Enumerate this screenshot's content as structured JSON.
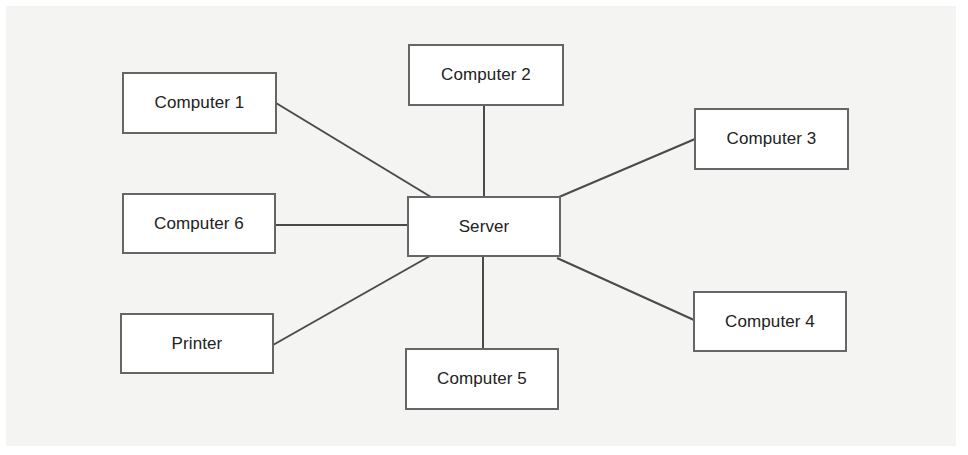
{
  "diagram": {
    "type": "star-network-topology",
    "colors": {
      "background": "#f4f4f3",
      "node_fill": "#ffffff",
      "node_border": "#666666",
      "link": "#4a4a4a",
      "text": "#222222"
    },
    "hub": {
      "id": "server",
      "label": "Server"
    },
    "nodes": [
      {
        "id": "computer-1",
        "label": "Computer 1"
      },
      {
        "id": "computer-2",
        "label": "Computer 2"
      },
      {
        "id": "computer-3",
        "label": "Computer 3"
      },
      {
        "id": "computer-4",
        "label": "Computer 4"
      },
      {
        "id": "computer-5",
        "label": "Computer 5"
      },
      {
        "id": "computer-6",
        "label": "Computer 6"
      },
      {
        "id": "printer",
        "label": "Printer"
      }
    ],
    "edges": [
      {
        "from": "server",
        "to": "computer-1"
      },
      {
        "from": "server",
        "to": "computer-2"
      },
      {
        "from": "server",
        "to": "computer-3"
      },
      {
        "from": "server",
        "to": "computer-4"
      },
      {
        "from": "server",
        "to": "computer-5"
      },
      {
        "from": "server",
        "to": "computer-6"
      },
      {
        "from": "server",
        "to": "printer"
      }
    ]
  }
}
